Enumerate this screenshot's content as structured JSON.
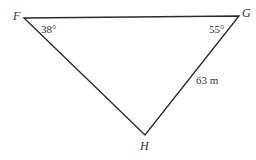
{
  "diagram": {
    "type": "triangle",
    "stroke_color": "#2b2b2b",
    "vertices": [
      {
        "label": "F",
        "angle": "38°"
      },
      {
        "label": "G",
        "angle": "55°"
      },
      {
        "label": "H"
      }
    ],
    "sides": [
      {
        "between": "G-H",
        "label": "63 m"
      }
    ]
  }
}
